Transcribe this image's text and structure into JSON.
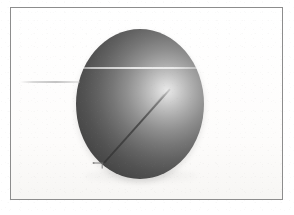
{
  "figure": {
    "title": "Shaded sphere with chord and radius",
    "caption": "",
    "frame": {
      "label": "figure-border",
      "border_color": "#8d8d8d",
      "background_color": "#fdfdfd"
    },
    "background": {
      "color": "#fefefe"
    },
    "sphere": {
      "label": "sphere",
      "center_x": 140,
      "center_y": 104,
      "radius_x": 64,
      "radius_y": 75,
      "highlight_x_pct": 71,
      "highlight_y_pct": 41,
      "highlight_color": "#e9e9e9",
      "midtone_color": "#8e8e8e",
      "terminator_color": "#4a4a4a",
      "shadow_color": "#363636"
    },
    "chord_line": {
      "label": "horizontal-chord",
      "color": "#ffffff",
      "y": 68,
      "x_start": 76,
      "x_end": 206
    },
    "chord_extension": {
      "label": "chord-extension-left",
      "color": "#b4b4b4",
      "y": 82,
      "x_start": 20,
      "x_end": 80
    },
    "radius_line": {
      "label": "diagonal-radius",
      "color": "#464646",
      "x_start": 104,
      "y_start": 162,
      "x_end": 170,
      "y_end": 88,
      "angle_deg": -52
    },
    "arrow_marker": {
      "label": "arrow-marker",
      "color": "#6a6a6a",
      "x": 98,
      "y": 164
    }
  }
}
